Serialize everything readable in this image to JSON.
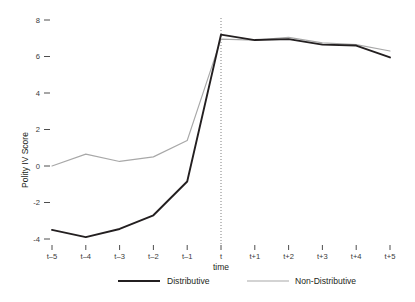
{
  "chart_data": {
    "type": "line",
    "title": "",
    "xlabel": "time",
    "ylabel": "Polity IV Score",
    "categories": [
      "t-5",
      "t-4",
      "t-3",
      "t-2",
      "t-1",
      "t",
      "t+1",
      "t+2",
      "t+3",
      "t+4",
      "t+5"
    ],
    "ylim": [
      -4.8,
      8.6
    ],
    "yticks": [
      8,
      6,
      4,
      2,
      0,
      -2,
      -4
    ],
    "ytick_labels": [
      "8",
      "6",
      "4",
      "2",
      "0",
      "-2",
      "-4"
    ],
    "grid": false,
    "legend_position": "bottom",
    "annotations": [
      {
        "type": "vertical-line",
        "at": "t",
        "style": "dotted",
        "color": "#808080"
      }
    ],
    "series": [
      {
        "name": "Distributive",
        "color": "#231f20",
        "width": 1.9,
        "values": [
          -3.5,
          -3.9,
          -3.45,
          -2.7,
          -0.85,
          7.2,
          6.9,
          6.95,
          6.65,
          6.6,
          5.95
        ]
      },
      {
        "name": "Non-Distributive",
        "color": "#a8a8a8",
        "width": 1.15,
        "values": [
          0.0,
          0.65,
          0.25,
          0.5,
          1.4,
          6.95,
          6.9,
          7.05,
          6.75,
          6.65,
          6.3
        ]
      }
    ]
  },
  "legend": {
    "items": [
      {
        "label": "Distributive",
        "color": "#231f20"
      },
      {
        "label": "Non-Distributive",
        "color": "#a8a8a8"
      }
    ]
  },
  "axis": {
    "y_label": "Polity IV Score",
    "x_label": "time"
  }
}
